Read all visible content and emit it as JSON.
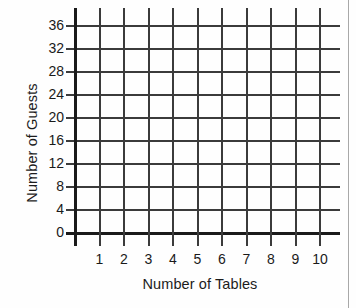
{
  "chart_data": {
    "type": "line",
    "title": "",
    "subtitle": "",
    "xlabel": "Number of Tables",
    "ylabel": "Number of Guests",
    "x_ticks": [
      1,
      2,
      3,
      4,
      5,
      6,
      7,
      8,
      9,
      10
    ],
    "y_ticks": [
      0,
      4,
      8,
      12,
      16,
      20,
      24,
      28,
      32,
      36
    ],
    "xlim": [
      0,
      10
    ],
    "ylim": [
      0,
      36
    ],
    "grid": true,
    "legend": null,
    "series": [],
    "annotations": [],
    "note": "Empty coordinate grid — no data plotted"
  },
  "axes": {
    "y_title": "Number of Guests",
    "x_title": "Number of Tables",
    "y_tick_labels": [
      "36",
      "32",
      "28",
      "24",
      "20",
      "16",
      "12",
      "8",
      "4",
      "0"
    ],
    "x_tick_labels": [
      "1",
      "2",
      "3",
      "4",
      "5",
      "6",
      "7",
      "8",
      "9",
      "10"
    ]
  },
  "colors": {
    "grid": "#3b3b3b",
    "axis": "#1a1a1a",
    "text": "#1a1a1a",
    "background": "#fefefe",
    "page_border": "#a8a8a8"
  }
}
